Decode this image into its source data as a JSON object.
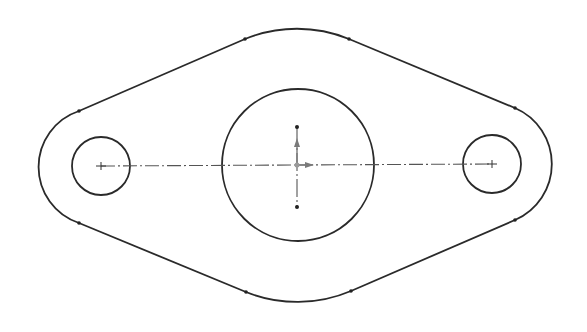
{
  "diagram": {
    "type": "cad-sketch",
    "colors": {
      "background": "#ffffff",
      "geometry": "#2a2a2a",
      "centerline": "#555555",
      "origin": "#7a7a7a"
    },
    "outline": {
      "left_arc": {
        "cx": 101,
        "cy": 166,
        "r": 59
      },
      "right_arc": {
        "cx": 492,
        "cy": 164,
        "r": 61
      },
      "top_arc": {
        "cx": 298,
        "cy": 165,
        "r": 137
      },
      "bottom_arc": {
        "cx": 298,
        "cy": 165,
        "r": 137
      },
      "tangent_points": [
        [
          79,
          111
        ],
        [
          245,
          39
        ],
        [
          349,
          39
        ],
        [
          515,
          108
        ],
        [
          515,
          220
        ],
        [
          351,
          291
        ],
        [
          246,
          292
        ],
        [
          79,
          223
        ]
      ]
    },
    "holes": [
      {
        "name": "left-hole",
        "cx": 101,
        "cy": 166,
        "r": 29
      },
      {
        "name": "center-bore",
        "cx": 298,
        "cy": 165,
        "r": 76
      },
      {
        "name": "right-hole",
        "cx": 492,
        "cy": 164,
        "r": 29
      }
    ],
    "centerlines": [
      {
        "name": "horizontal",
        "x1": 101,
        "y1": 166,
        "x2": 492,
        "y2": 164
      },
      {
        "name": "vertical",
        "x1": 297,
        "y1": 127,
        "x2": 297,
        "y2": 207
      }
    ],
    "origin": {
      "x": 297,
      "y": 165
    }
  }
}
